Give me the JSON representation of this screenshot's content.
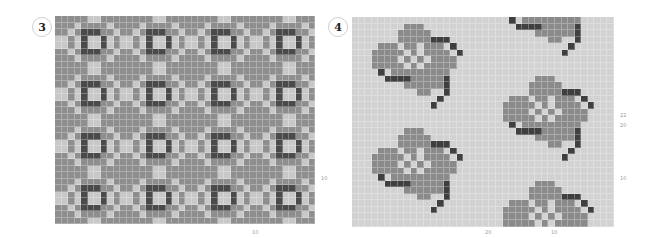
{
  "charts": [
    {
      "id": "chart-3",
      "number": "3",
      "left": 55,
      "top": 16,
      "cols": 40,
      "rows": 32,
      "cell": 6.5,
      "colors": {
        "0": "#8e8e8e",
        "1": "#c8c8c8",
        "2": "#4a4a4a"
      },
      "repeat": [
        "0000011000",
        "0001000010",
        "0010222001",
        "1101211210",
        "1101211210",
        "0010222001",
        "0001000010",
        "0000011000"
      ],
      "labels": [
        {
          "text": "10",
          "x": 321,
          "y": 175
        },
        {
          "text": "10",
          "x": 252,
          "y": 229
        }
      ]
    },
    {
      "id": "chart-4",
      "number": "4",
      "left": 352,
      "top": 17,
      "cols": 40,
      "rows": 32,
      "cell": 6.55,
      "colors": {
        "0": "#d2d2d2",
        "1": "#8a8a8a",
        "2": "#3f3f3f"
      },
      "repeat": [
        "00000000000000000000",
        "00000000111000000000",
        "00000001111100000000",
        "00000001111122200000",
        "00001110110111020000",
        "00011111010111102000",
        "00011110101011110000",
        "00011111010111110000",
        "00002011111111100000",
        "00000222211111200000",
        "00000000111111200000",
        "00000000001100200000",
        "00000000000002000000",
        "00000000000020000000",
        "00000000000000000000",
        "00000000000000000000"
      ],
      "labels": [
        {
          "text": "22",
          "x": 620,
          "y": 112
        },
        {
          "text": "20",
          "x": 620,
          "y": 122
        },
        {
          "text": "10",
          "x": 620,
          "y": 175
        },
        {
          "text": "20",
          "x": 485,
          "y": 229
        },
        {
          "text": "10",
          "x": 551,
          "y": 229
        }
      ]
    }
  ]
}
